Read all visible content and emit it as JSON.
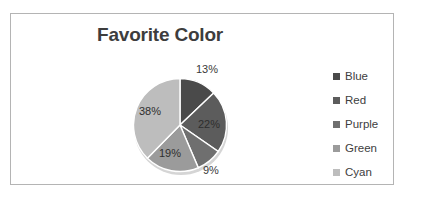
{
  "chart_data": {
    "type": "pie",
    "title": "Favorite Color",
    "categories": [
      "Blue",
      "Red",
      "Purple",
      "Green",
      "Cyan"
    ],
    "values": [
      13,
      22,
      9,
      19,
      38
    ],
    "value_labels": [
      "13%",
      "22%",
      "9%",
      "19%",
      "38%"
    ],
    "unit": "percent",
    "label_placement": [
      "outside",
      "inside",
      "outside",
      "inside",
      "inside"
    ],
    "start_angle_deg": 0,
    "direction": "clockwise",
    "legend_position": "right",
    "grid": false,
    "xlabel": "",
    "ylabel": "",
    "slice_colors": [
      "#4a4a4a",
      "#5c5c5c",
      "#6f6f6f",
      "#9b9b9b",
      "#bdbdbd"
    ],
    "slice_border_color": "#ffffff"
  },
  "frame": {
    "background": "#ffffff",
    "border_color": "#b4b4b4"
  },
  "title": {
    "text": "Favorite Color",
    "color": "#3d3d3d"
  },
  "legend": {
    "items": [
      {
        "label": "Blue",
        "color": "#4a4a4a"
      },
      {
        "label": "Red",
        "color": "#5c5c5c"
      },
      {
        "label": "Purple",
        "color": "#6f6f6f"
      },
      {
        "label": "Green",
        "color": "#9b9b9b"
      },
      {
        "label": "Cyan",
        "color": "#bdbdbd"
      }
    ]
  },
  "labels": {
    "blue": "13%",
    "red": "22%",
    "purple": "9%",
    "green": "19%",
    "cyan": "38%"
  }
}
